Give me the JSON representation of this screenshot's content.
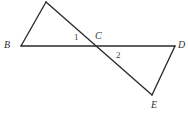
{
  "figure": {
    "width": 188,
    "height": 118,
    "background_color": "#ffffff",
    "line_color": "#2a2a2a",
    "label_color": "#2f2f2f",
    "points": [
      {
        "id": "A",
        "label": "",
        "x": 46,
        "y": 2,
        "labeled": false,
        "note": "unlabeled apex, clipped at top edge"
      },
      {
        "id": "B",
        "label": "B",
        "x": 21,
        "y": 46,
        "label_x": 4,
        "label_y": 40
      },
      {
        "id": "C",
        "label": "C",
        "x": 95,
        "y": 46,
        "label_x": 95,
        "label_y": 31
      },
      {
        "id": "D",
        "label": "D",
        "x": 175,
        "y": 46,
        "label_x": 178,
        "label_y": 40
      },
      {
        "id": "E",
        "label": "E",
        "x": 152,
        "y": 95,
        "label_x": 151,
        "label_y": 100
      }
    ],
    "segments": [
      {
        "id": "B-A",
        "from": "B",
        "to": "A"
      },
      {
        "id": "A-E",
        "from": "A",
        "to": "E",
        "note": "long diagonal passing through C"
      },
      {
        "id": "B-D",
        "from": "B",
        "to": "D",
        "note": "horizontal base through C"
      },
      {
        "id": "D-E",
        "from": "D",
        "to": "E"
      }
    ],
    "angle_labels": [
      {
        "id": "angle-1",
        "text": "1",
        "x": 74,
        "y": 33
      },
      {
        "id": "angle-2",
        "text": "2",
        "x": 116,
        "y": 51
      }
    ]
  }
}
